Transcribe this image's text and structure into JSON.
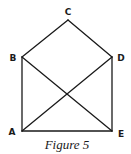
{
  "figure": {
    "caption": "Figure 5",
    "line_color": "#1a1a1a",
    "vertices": [
      {
        "label": "A",
        "x": 22,
        "y": 131
      },
      {
        "label": "B",
        "x": 22,
        "y": 57
      },
      {
        "label": "C",
        "x": 68,
        "y": 20
      },
      {
        "label": "D",
        "x": 112,
        "y": 57
      },
      {
        "label": "E",
        "x": 112,
        "y": 131
      }
    ],
    "edges": [
      [
        "A",
        "B"
      ],
      [
        "B",
        "C"
      ],
      [
        "C",
        "D"
      ],
      [
        "D",
        "E"
      ],
      [
        "E",
        "A"
      ],
      [
        "B",
        "E"
      ],
      [
        "A",
        "D"
      ]
    ],
    "labels": {
      "A": "A",
      "B": "B",
      "C": "C",
      "D": "D",
      "E": "E"
    }
  }
}
